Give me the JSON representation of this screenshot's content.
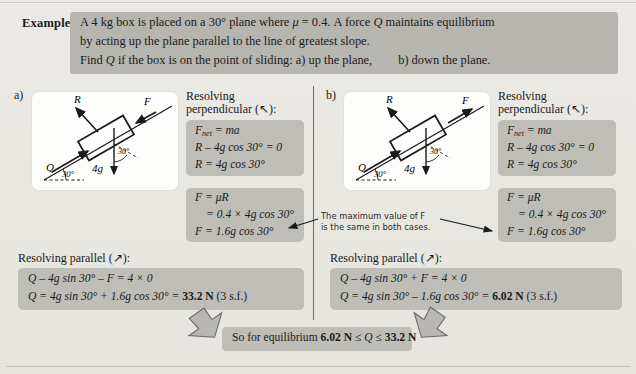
{
  "header": {
    "label": "Example:",
    "line1_a": "A 4 kg box is placed on a 30° plane where ",
    "line1_mu": "μ",
    "line1_b": " = 0.4.  A force ",
    "line1_q": "Q",
    "line1_c": " maintains equilibrium",
    "line2": "by acting up the plane parallel to the line of greatest slope.",
    "line3_a": "Find ",
    "line3_q": "Q",
    "line3_b": " if the box is on the point of sliding:   a) up the plane,",
    "line3_c": "b)  down the plane."
  },
  "panel_a": {
    "label": "a)",
    "diagram": {
      "force_R": "R",
      "force_F": "F",
      "force_Q": "Q",
      "weight": "4g",
      "angle_incline": "30°",
      "angle_weight": "30°"
    },
    "perp_title_1": "Resolving",
    "perp_title_2": "perpendicular (↖):",
    "perp_eq1_a": "F",
    "perp_eq1_sub": "net",
    "perp_eq1_b": " = ma",
    "perp_eq2": "R – 4g cos 30° = 0",
    "perp_eq3": "R = 4g cos 30°",
    "fric_eq1": "F = μR",
    "fric_eq2": "= 0.4 × 4g cos 30°",
    "fric_eq3": "F = 1.6g cos 30°",
    "par_title": "Resolving parallel (↗):",
    "par_eq1": "Q – 4g sin 30° – F = 4 × 0",
    "par_eq2_a": "Q = 4g sin 30° + 1.6g cos 30° = ",
    "par_eq2_result": "33.2 N",
    "par_eq2_b": " (3 s.f.)"
  },
  "panel_b": {
    "label": "b)",
    "diagram": {
      "force_R": "R",
      "force_F": "F",
      "force_Q": "Q",
      "weight": "4g",
      "angle_incline": "30°",
      "angle_weight": "30°"
    },
    "perp_title_1": "Resolving",
    "perp_title_2": "perpendicular (↖):",
    "perp_eq1_a": "F",
    "perp_eq1_sub": "net",
    "perp_eq1_b": " = ma",
    "perp_eq2": "R – 4g cos 30° = 0",
    "perp_eq3": "R = 4g cos 30°",
    "fric_eq1": "F = μR",
    "fric_eq2": "= 0.4 × 4g cos 30°",
    "fric_eq3": "F = 1.6g cos 30°",
    "par_title": "Resolving parallel (↗):",
    "par_eq1": "Q – 4g sin 30° + F = 4 × 0",
    "par_eq2_a": "Q = 4g sin 30° – 1.6g cos 30° = ",
    "par_eq2_result": "6.02 N",
    "par_eq2_b": " (3 s.f.)"
  },
  "note": {
    "line1": "The maximum value of F",
    "line2": "is the same in both cases."
  },
  "conclusion": {
    "text_a": "So for equilibrium ",
    "min": "6.02 N",
    "le1": " ≤ ",
    "q": "Q",
    "le2": " ≤ ",
    "max": "33.2 N"
  },
  "colors": {
    "page_bg": "#e9e8e4",
    "header_band": "#b7b5b0",
    "eq_block": "#bfbdb8",
    "card": "#fdfdfc",
    "ink": "#1a1a1a",
    "arrow_gray": "#8d8b86"
  }
}
